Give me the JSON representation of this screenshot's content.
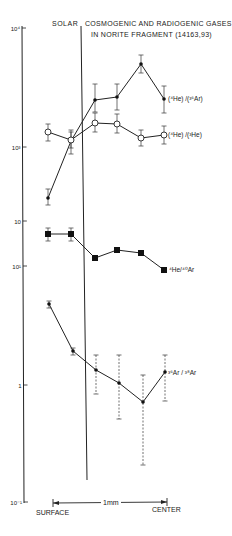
{
  "chart_data": {
    "type": "line",
    "title": "COSMOGENIC AND RADIOGENIC GASES IN NORITE FRAGMENT (14163,93)",
    "title_line1": "COSMOGENIC AND RADIOGENIC GASES",
    "title_line2": "IN NORITE FRAGMENT (14163,93)",
    "solar_label": "SOLAR",
    "xlabel_left": "SURFACE",
    "xlabel_right": "CENTER",
    "scale_label": "1mm",
    "ylabel": "",
    "yscale": "log",
    "ylim": [
      0.1,
      10000
    ],
    "y_ticks": [
      {
        "label": "10⁴",
        "y": 28
      },
      {
        "label": "10³",
        "y": 147
      },
      {
        "label": "10",
        "y": 221
      },
      {
        "label": "10¹",
        "y": 266
      },
      {
        "label": "1",
        "y": 385
      },
      {
        "label": "10⁻¹",
        "y": 502
      }
    ],
    "x": [
      1,
      2,
      3,
      4,
      5,
      6
    ],
    "series": [
      {
        "name": "(4He)/(36Ar)",
        "label_main": "(⁴He) /(³⁶Ar)",
        "marker": "small-filled",
        "line": "solid",
        "px": [
          48,
          71,
          95,
          117,
          141,
          164
        ],
        "py": [
          198,
          141,
          100,
          97,
          64,
          99
        ],
        "err_top": [
          189,
          132,
          84,
          84,
          55,
          86
        ],
        "err_bot": [
          205,
          154,
          112,
          110,
          73,
          113
        ],
        "values": [
          370,
          1150,
          2500,
          2600,
          5100,
          2600
        ]
      },
      {
        "name": "(4He)/(3He)",
        "label_main": "(⁴He) /(³He)",
        "marker": "open-circle",
        "line": "solid",
        "px": [
          48,
          71,
          95,
          117,
          141,
          164
        ],
        "py": [
          132,
          140,
          123,
          124,
          138,
          135
        ],
        "err_top": [
          124,
          130,
          113,
          114,
          130,
          126
        ],
        "err_bot": [
          141,
          148,
          132,
          133,
          146,
          144
        ],
        "values": [
          1340,
          1150,
          1590,
          1560,
          1200,
          1260
        ]
      },
      {
        "name": "4He/40Ar",
        "label_main": "⁴He/⁴⁰Ar",
        "marker": "filled-square",
        "line": "solid",
        "px": [
          48,
          71,
          95,
          117,
          141,
          164
        ],
        "py": [
          234,
          234,
          258,
          250,
          253,
          270
        ],
        "err_top": [
          228,
          228,
          258,
          250,
          253,
          270
        ],
        "err_bot": [
          241,
          241,
          258,
          250,
          253,
          270
        ],
        "values": [
          185,
          185,
          117,
          136,
          128,
          93
        ]
      },
      {
        "name": "36Ar/38Ar",
        "label_main": "³⁶Ar / ³⁸Ar",
        "marker": "small-filled",
        "line": "solid",
        "px": [
          49,
          73,
          96,
          119,
          143,
          165
        ],
        "py": [
          304,
          351,
          370,
          383,
          402,
          372
        ],
        "err_top": [
          301,
          348,
          355,
          355,
          375,
          355
        ],
        "err_bot": [
          308,
          355,
          394,
          419,
          465,
          401
        ],
        "err_dashed": [
          false,
          false,
          true,
          true,
          true,
          true
        ],
        "values": [
          48,
          19,
          13.4,
          10.4,
          7.2,
          12.6
        ]
      }
    ]
  }
}
